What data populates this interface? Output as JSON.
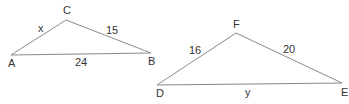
{
  "figure": {
    "line_color": "#8a8a8a",
    "text_color": "#333333",
    "triangles": [
      {
        "name": "ABC",
        "vertices": [
          {
            "label": "A",
            "x": 11,
            "y": 55,
            "lx": 8,
            "ly": 67
          },
          {
            "label": "C",
            "x": 66,
            "y": 20,
            "lx": 63,
            "ly": 14
          },
          {
            "label": "B",
            "x": 151,
            "y": 53,
            "lx": 148,
            "ly": 65
          }
        ],
        "sides": [
          {
            "between": "AC",
            "label": "x",
            "lx": 38,
            "ly": 32
          },
          {
            "between": "CB",
            "label": "15",
            "lx": 106,
            "ly": 34
          },
          {
            "between": "AB",
            "label": "24",
            "lx": 75,
            "ly": 66
          }
        ]
      },
      {
        "name": "DEF",
        "vertices": [
          {
            "label": "D",
            "x": 157,
            "y": 85,
            "lx": 156,
            "ly": 97
          },
          {
            "label": "F",
            "x": 236,
            "y": 33,
            "lx": 233,
            "ly": 28
          },
          {
            "label": "E",
            "x": 342,
            "y": 83,
            "lx": 341,
            "ly": 96
          }
        ],
        "sides": [
          {
            "between": "DF",
            "label": "16",
            "lx": 189,
            "ly": 54
          },
          {
            "between": "FE",
            "label": "20",
            "lx": 283,
            "ly": 53
          },
          {
            "between": "DE",
            "label": "y",
            "lx": 245,
            "ly": 96
          }
        ]
      }
    ]
  },
  "labels": {
    "A": "A",
    "B": "B",
    "C": "C",
    "D": "D",
    "E": "E",
    "F": "F",
    "side_AC": "x",
    "side_CB": "15",
    "side_AB": "24",
    "side_DF": "16",
    "side_FE": "20",
    "side_DE": "y"
  }
}
